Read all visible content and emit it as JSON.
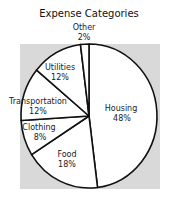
{
  "chart_data": {
    "type": "pie",
    "title": "Expense Categories",
    "categories": [
      "Housing",
      "Food",
      "Clothing",
      "Transportation",
      "Utilities",
      "Other"
    ],
    "values": [
      48,
      18,
      8,
      12,
      12,
      2
    ],
    "unit": "%",
    "start_angle": "12 o'clock",
    "direction": "clockwise",
    "legend": "none (labels on slices)",
    "slice_labels": [
      {
        "name": "Housing",
        "value": "48%"
      },
      {
        "name": "Food",
        "value": "18%"
      },
      {
        "name": "Clothing",
        "value": "8%"
      },
      {
        "name": "Transportation",
        "value": "12%"
      },
      {
        "name": "Utilities",
        "value": "12%"
      },
      {
        "name": "Other",
        "value": "2%"
      }
    ]
  },
  "colors": {
    "plot_background": "#d9d9d9",
    "slice_fill": "#ffffff",
    "slice_stroke": "#111111"
  }
}
